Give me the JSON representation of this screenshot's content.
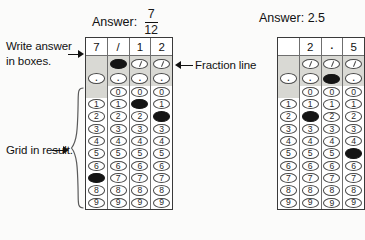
{
  "annotations": {
    "write_answer": "Write answer in boxes.",
    "grid_in_result": "Grid in result.",
    "fraction_line": "Fraction line"
  },
  "examples": [
    {
      "id": "fraction-example",
      "answer_label": "Answer:",
      "answer_kind": "fraction",
      "numerator": "7",
      "denominator": "12",
      "answer_text": "7/12",
      "columns": [
        {
          "typed": "7",
          "has_slash_bubble": false,
          "has_zero_bubble": false,
          "has_dot_bubble": true,
          "filled": "7"
        },
        {
          "typed": "/",
          "has_slash_bubble": true,
          "has_zero_bubble": true,
          "has_dot_bubble": true,
          "filled": "/"
        },
        {
          "typed": "1",
          "has_slash_bubble": true,
          "has_zero_bubble": true,
          "has_dot_bubble": true,
          "filled": "1"
        },
        {
          "typed": "2",
          "has_slash_bubble": true,
          "has_zero_bubble": true,
          "has_dot_bubble": true,
          "filled": "2"
        }
      ]
    },
    {
      "id": "decimal-example",
      "answer_label": "Answer: 2.5",
      "answer_kind": "decimal",
      "answer_text": "2.5",
      "columns": [
        {
          "typed": "",
          "has_slash_bubble": false,
          "has_zero_bubble": false,
          "has_dot_bubble": true,
          "filled": ""
        },
        {
          "typed": "2",
          "has_slash_bubble": true,
          "has_zero_bubble": true,
          "has_dot_bubble": true,
          "filled": "2"
        },
        {
          "typed": ".",
          "has_slash_bubble": true,
          "has_zero_bubble": true,
          "has_dot_bubble": true,
          "filled": "."
        },
        {
          "typed": "5",
          "has_slash_bubble": true,
          "has_zero_bubble": true,
          "has_dot_bubble": true,
          "filled": "5"
        }
      ]
    }
  ],
  "digits": [
    "0",
    "1",
    "2",
    "3",
    "4",
    "5",
    "6",
    "7",
    "8",
    "9"
  ],
  "symbols": {
    "slash": "/",
    "dot": "."
  },
  "colors": {
    "page_background": "#fbfbfa",
    "grid_border": "#3a3a3a",
    "bubble_outline": "#4a4a4a",
    "bubble_filled": "#151515",
    "shaded_cell": "#d7d7d2",
    "band": "#d9d9d4",
    "text": "#111111"
  }
}
